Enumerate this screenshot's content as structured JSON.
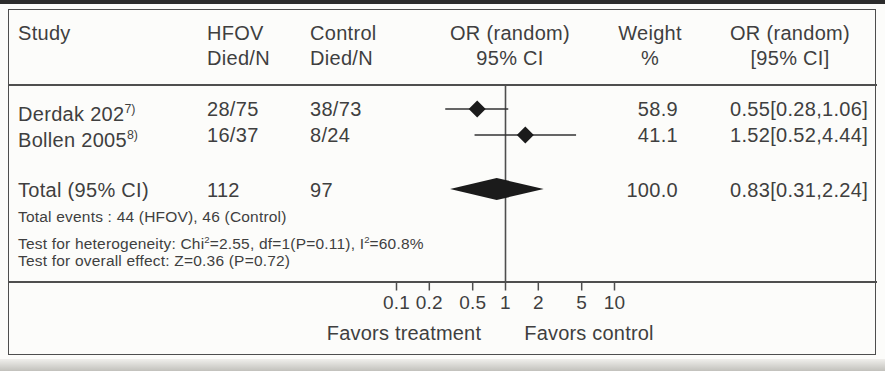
{
  "colors": {
    "text": "#3f3f3f",
    "line": "#4e4e4e",
    "diamond_fill": "#1b1b1b",
    "background": "#fcfcfa",
    "top_edge": "#2c2c2c"
  },
  "figure": {
    "header": {
      "study": "Study",
      "hfov": {
        "l1": "HFOV",
        "l2": "Died/N"
      },
      "control": {
        "l1": "Control",
        "l2": "Died/N"
      },
      "plot": {
        "l1": "OR (random)",
        "l2": "95% CI"
      },
      "weight": {
        "l1": "Weight",
        "l2": "%"
      },
      "or": {
        "l1": "OR (random)",
        "l2": "[95% CI]"
      }
    },
    "rows": [
      {
        "study": "Derdak 202",
        "ref": "7)",
        "hfov": "28/75",
        "control": "38/73",
        "weight": "58.9",
        "or_ci": "0.55[0.28,1.06]"
      },
      {
        "study": "Bollen 2005",
        "ref": "8)",
        "hfov": "16/37",
        "control": "8/24",
        "weight": "41.1",
        "or_ci": "1.52[0.52,4.44]"
      }
    ],
    "total": {
      "label": "Total (95% CI)",
      "hfov": "112",
      "control": "97",
      "weight": "100.0",
      "or_ci": "0.83[0.31,2.24]"
    },
    "footnotes": {
      "events": "Total events : 44 (HFOV), 46 (Control)",
      "het": {
        "pre": "Test for heterogeneity: Chi",
        "sup1": "2",
        "mid": "=2.55, df=1(P=0.11), I",
        "sup2": "2",
        "post": "=60.8%"
      },
      "overall": "Test for overall effect: Z=0.36 (P=0.72)"
    },
    "axis": {
      "favors_left": "Favors treatment",
      "favors_right": "Favors control"
    }
  },
  "chart_data": {
    "type": "scatter",
    "subtype": "forest_plot_meta_analysis",
    "title": "",
    "x_scale": "log",
    "x_ticks": [
      0.1,
      0.2,
      0.5,
      1,
      2,
      5,
      10
    ],
    "x_range": [
      0.1,
      10
    ],
    "null_line": 1,
    "effect_measure": "OR (random) 95% CI",
    "xlabel_left": "Favors treatment",
    "xlabel_right": "Favors control",
    "studies": [
      {
        "name": "Derdak 202",
        "reference": "7)",
        "hfov_died_n": "28/75",
        "control_died_n": "38/73",
        "or": 0.55,
        "ci_low": 0.28,
        "ci_high": 1.06,
        "weight_pct": 58.9
      },
      {
        "name": "Bollen 2005",
        "reference": "8)",
        "hfov_died_n": "16/37",
        "control_died_n": "8/24",
        "or": 1.52,
        "ci_low": 0.52,
        "ci_high": 4.44,
        "weight_pct": 41.1
      }
    ],
    "total": {
      "label": "Total (95% CI)",
      "hfov_n": 112,
      "control_n": 97,
      "or": 0.83,
      "ci_low": 0.31,
      "ci_high": 2.24,
      "weight_pct": 100.0
    },
    "total_events": "44 (HFOV), 46 (Control)",
    "heterogeneity": "Chi2=2.55, df=1(P=0.11), I2=60.8%",
    "overall_effect": "Z=0.36 (P=0.72)"
  }
}
